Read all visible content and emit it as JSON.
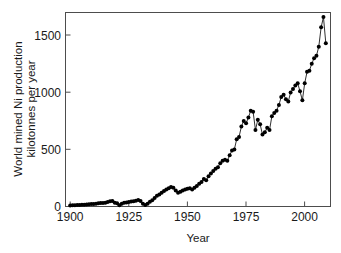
{
  "chart_data": {
    "type": "line",
    "title": "",
    "xlabel": "Year",
    "ylabel": "World mined Ni production kilotonnes per year",
    "ylabel_line1": "World mined Ni production",
    "ylabel_line2": "kilotonnes per year",
    "xlim": [
      1898,
      2011
    ],
    "ylim": [
      0,
      1700
    ],
    "xticks": [
      1900,
      1925,
      1950,
      1975,
      2000
    ],
    "xtick_labels": [
      "1900",
      "1925",
      "1950",
      "1975",
      "2000"
    ],
    "yticks": [
      0,
      500,
      1000,
      1500
    ],
    "ytick_labels": [
      "0",
      "500",
      "1000",
      "1500"
    ],
    "grid": false,
    "legend": false,
    "marker": "filled-circle",
    "line_color": "#1a1a1a",
    "marker_color": "#000000",
    "series": [
      {
        "name": "World mined Ni production",
        "x": [
          1900,
          1901,
          1902,
          1903,
          1904,
          1905,
          1906,
          1907,
          1908,
          1909,
          1910,
          1911,
          1912,
          1913,
          1914,
          1915,
          1916,
          1917,
          1918,
          1919,
          1920,
          1921,
          1922,
          1923,
          1924,
          1925,
          1926,
          1927,
          1928,
          1929,
          1930,
          1931,
          1932,
          1933,
          1934,
          1935,
          1936,
          1937,
          1938,
          1939,
          1940,
          1941,
          1942,
          1943,
          1944,
          1945,
          1946,
          1947,
          1948,
          1949,
          1950,
          1951,
          1952,
          1953,
          1954,
          1955,
          1956,
          1957,
          1958,
          1959,
          1960,
          1961,
          1962,
          1963,
          1964,
          1965,
          1966,
          1967,
          1968,
          1969,
          1970,
          1971,
          1972,
          1973,
          1974,
          1975,
          1976,
          1977,
          1978,
          1979,
          1980,
          1981,
          1982,
          1983,
          1984,
          1985,
          1986,
          1987,
          1988,
          1989,
          1990,
          1991,
          1992,
          1993,
          1994,
          1995,
          1996,
          1997,
          1998,
          1999,
          2000,
          2001,
          2002,
          2003,
          2004,
          2005,
          2006,
          2007,
          2008,
          2009
        ],
        "values": [
          9,
          10,
          12,
          13,
          14,
          15,
          16,
          17,
          19,
          21,
          23,
          25,
          28,
          30,
          30,
          33,
          40,
          46,
          48,
          32,
          28,
          12,
          25,
          32,
          36,
          40,
          43,
          46,
          50,
          56,
          48,
          25,
          14,
          25,
          42,
          55,
          75,
          95,
          105,
          120,
          135,
          150,
          160,
          170,
          165,
          140,
          120,
          130,
          140,
          148,
          155,
          160,
          150,
          165,
          180,
          200,
          215,
          240,
          230,
          265,
          290,
          310,
          330,
          345,
          380,
          400,
          410,
          400,
          450,
          490,
          500,
          590,
          610,
          700,
          750,
          730,
          780,
          840,
          830,
          670,
          760,
          720,
          630,
          650,
          690,
          670,
          790,
          820,
          840,
          890,
          960,
          980,
          940,
          920,
          1000,
          1030,
          1060,
          1080,
          1010,
          930,
          1080,
          1180,
          1190,
          1250,
          1300,
          1320,
          1400,
          1570,
          1660,
          1430
        ]
      }
    ]
  },
  "axes": {
    "x_title": "Year",
    "y_title_line1": "World mined Ni production",
    "y_title_line2": "kilotonnes per year"
  },
  "colors": {
    "frame": "#4d4d4d",
    "data": "#000000",
    "background": "#ffffff"
  }
}
